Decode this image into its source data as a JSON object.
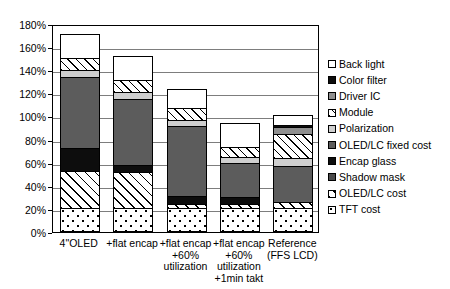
{
  "chart_data": {
    "type": "bar",
    "subtype": "stacked-bar",
    "title": "",
    "xlabel": "",
    "ylabel": "",
    "ylim": [
      0,
      180
    ],
    "yunit": "%",
    "grid": true,
    "legend_position": "right",
    "ytick_labels": [
      "180%",
      "160%",
      "140%",
      "120%",
      "100%",
      "80%",
      "60%",
      "40%",
      "20%",
      "0%"
    ],
    "ytick_values": [
      180,
      160,
      140,
      120,
      100,
      80,
      60,
      40,
      20,
      0
    ],
    "categories": [
      "4\"OLED",
      "+flat encap",
      "+flat encap\n+60%\nutilization",
      "+flat encap\n+60%\nutilization\n+1min takt",
      "Reference\n(FFS LCD)"
    ],
    "series": [
      {
        "name": "TFT cost",
        "pattern": "dots",
        "values": [
          21,
          21,
          21,
          21,
          21
        ]
      },
      {
        "name": "OLED/LC cost",
        "pattern": "hatch",
        "values": [
          32,
          31,
          3,
          3,
          5
        ]
      },
      {
        "name": "Shadow mask",
        "pattern": "darkgray",
        "values": [
          0,
          0,
          0,
          0,
          0
        ]
      },
      {
        "name": "Encap glass",
        "pattern": "black",
        "values": [
          20,
          6,
          7,
          6,
          0
        ]
      },
      {
        "name": "OLED/LC fixed cost",
        "pattern": "midgray",
        "values": [
          61,
          57,
          61,
          30,
          31
        ]
      },
      {
        "name": "Polarization",
        "pattern": "palegray",
        "values": [
          6,
          6,
          5,
          5,
          7
        ]
      },
      {
        "name": "Module",
        "pattern": "hatch-sm",
        "values": [
          11,
          11,
          10,
          9,
          21
        ]
      },
      {
        "name": "Driver IC",
        "pattern": "gray",
        "values": [
          0,
          0,
          0,
          0,
          6
        ]
      },
      {
        "name": "Color filter",
        "pattern": "black",
        "values": [
          0,
          0,
          0,
          0,
          2
        ]
      },
      {
        "name": "Back light",
        "pattern": "white",
        "values": [
          20,
          20,
          17,
          20,
          8
        ]
      }
    ],
    "totals": [
      171,
      152,
      124,
      94,
      101
    ]
  },
  "axis": {
    "y_ticks": [
      {
        "label": "180%",
        "value": 180
      },
      {
        "label": "160%",
        "value": 160
      },
      {
        "label": "140%",
        "value": 140
      },
      {
        "label": "120%",
        "value": 120
      },
      {
        "label": "100%",
        "value": 100
      },
      {
        "label": "80%",
        "value": 80
      },
      {
        "label": "60%",
        "value": 60
      },
      {
        "label": "40%",
        "value": 40
      },
      {
        "label": "20%",
        "value": 20
      },
      {
        "label": "0%",
        "value": 0
      }
    ]
  },
  "xaxis": {
    "labels": [
      "4\"OLED",
      "+flat encap",
      "+flat encap\n+60%\nutilization",
      "+flat encap\n+60%\nutilization\n+1min takt",
      "Reference\n(FFS LCD)"
    ]
  },
  "legend": {
    "items": [
      {
        "label": "Back light",
        "pattern": "white"
      },
      {
        "label": "Color filter",
        "pattern": "black"
      },
      {
        "label": "Driver IC",
        "pattern": "gray"
      },
      {
        "label": "Module",
        "pattern": "hatch-sm"
      },
      {
        "label": "Polarization",
        "pattern": "palegray"
      },
      {
        "label": "OLED/LC fixed cost",
        "pattern": "midgray"
      },
      {
        "label": "Encap glass",
        "pattern": "black"
      },
      {
        "label": "Shadow mask",
        "pattern": "darkgray"
      },
      {
        "label": "OLED/LC cost",
        "pattern": "hatch"
      },
      {
        "label": "TFT cost",
        "pattern": "dots"
      }
    ]
  },
  "colors": {
    "white": "#ffffff",
    "black": "#0d0d0d",
    "darkgray": "#4a4a4a",
    "midgray": "#5c5c5c",
    "gray": "#8f8f8f",
    "lightgray": "#b8b8b8",
    "palegray": "#cfcfcf",
    "gridline": "#7d7d7d",
    "axis": "#000000"
  }
}
